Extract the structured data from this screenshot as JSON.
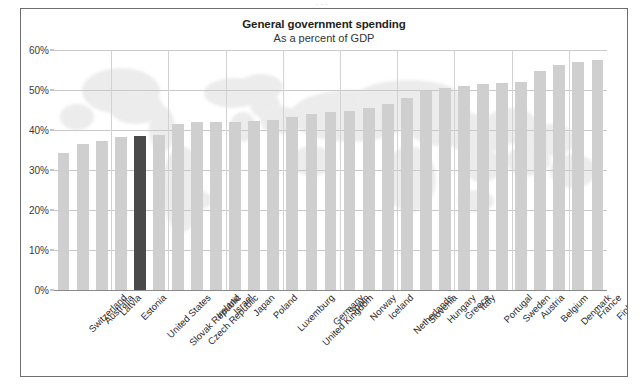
{
  "clipped_caption": {
    "text": "· · ·"
  },
  "chart_data": {
    "type": "bar",
    "title": "General government spending",
    "subtitle": "As a percent of GDP",
    "xlabel": "",
    "ylabel": "",
    "ylim": [
      0,
      60
    ],
    "ytick_labels": [
      "0%",
      "10%",
      "20%",
      "30%",
      "40%",
      "50%",
      "60%"
    ],
    "ytick_values": [
      0,
      10,
      20,
      30,
      40,
      50,
      60
    ],
    "grid": "horizontal-and-vertical",
    "legend": "none",
    "highlight_category": "United States",
    "highlight_color": "#4a4a4a",
    "bar_color": "#cfcfcf",
    "categories": [
      "Switzerland",
      "Australia",
      "Latvia",
      "Estonia",
      "United States",
      "Slovak Republic",
      "Czech Republic",
      "Ireland",
      "Israel",
      "Japan",
      "Poland",
      "Luxemburg",
      "United Kingdom",
      "Germany",
      "Spain",
      "Norway",
      "Iceland",
      "Netherlands",
      "Slovenia",
      "Hungary",
      "Greece",
      "Italy",
      "Portugal",
      "Sweden",
      "Austria",
      "Belgium",
      "Denmark",
      "France",
      "Finland"
    ],
    "values": [
      34.3,
      36.5,
      37.3,
      38.2,
      38.5,
      38.7,
      41.5,
      41.9,
      42.0,
      42.1,
      42.2,
      42.6,
      43.2,
      44.1,
      44.4,
      44.7,
      45.5,
      46.4,
      48.0,
      49.8,
      50.5,
      51.0,
      51.5,
      51.7,
      52.1,
      54.8,
      56.2,
      57.1,
      57.6
    ]
  }
}
